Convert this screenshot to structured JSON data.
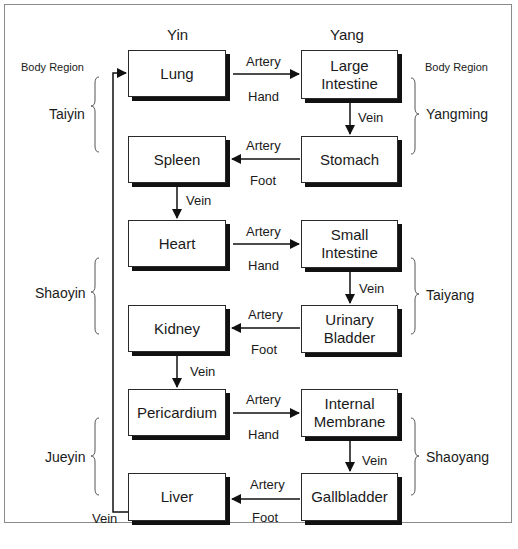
{
  "columns": {
    "yin": "Yin",
    "yang": "Yang"
  },
  "body_region_label_left": "Body Region",
  "body_region_label_right": "Body Region",
  "regions_left": [
    "Taiyin",
    "Shaoyin",
    "Jueyin"
  ],
  "regions_right": [
    "Yangming",
    "Taiyang",
    "Shaoyang"
  ],
  "nodes": {
    "lung": "Lung",
    "large_intestine": "Large Intestine",
    "stomach": "Stomach",
    "spleen": "Spleen",
    "heart": "Heart",
    "small_intestine": "Small Intestine",
    "urinary_bladder": "Urinary Bladder",
    "kidney": "Kidney",
    "pericardium": "Pericardium",
    "internal_membrane": "Internal Membrane",
    "gallbladder": "Gallbladder",
    "liver": "Liver"
  },
  "edge_labels": {
    "artery": "Artery",
    "hand": "Hand",
    "foot": "Foot",
    "vein": "Vein"
  }
}
